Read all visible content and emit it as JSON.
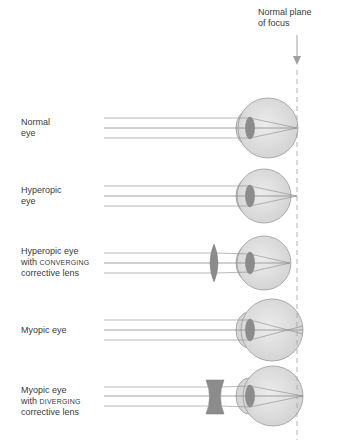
{
  "header": {
    "plane_label_line1": "Normal plane",
    "plane_label_line2": "of focus"
  },
  "colors": {
    "eyeball_fill": "#dcdcdc",
    "eyeball_stroke": "#9a9a9a",
    "lens_fill": "#8c8c8c",
    "ray_color": "#8a8a8a",
    "dash_color": "#a8a8a8"
  },
  "rows": [
    {
      "id": "normal",
      "line1": "Normal",
      "line2": "eye",
      "line3": ""
    },
    {
      "id": "hyperopic",
      "line1": "Hyperopic",
      "line2": "eye",
      "line3": ""
    },
    {
      "id": "hyperopic-corrected",
      "line1": "Hyperopic eye",
      "line2_prefix": "with ",
      "line2_sc": "CONVERGING",
      "line3": "corrective lens"
    },
    {
      "id": "myopic",
      "line1": "Myopic eye",
      "line2": "",
      "line3": ""
    },
    {
      "id": "myopic-corrected",
      "line1": "Myopic eye",
      "line2_prefix": "with ",
      "line2_sc": "DIVERGING",
      "line3": "corrective lens"
    }
  ]
}
